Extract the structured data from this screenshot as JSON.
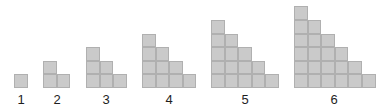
{
  "diagram": {
    "colors": {
      "cell_fill": "#cacaca",
      "cell_border": "#b0b0b0",
      "label": "#1e1e1e",
      "background": "#ffffff"
    },
    "figures": [
      {
        "label": "1",
        "columns": [
          1
        ],
        "left": 14,
        "label_x": 21
      },
      {
        "label": "2",
        "columns": [
          2,
          1
        ],
        "left": 43,
        "label_x": 57
      },
      {
        "label": "3",
        "columns": [
          3,
          2,
          1
        ],
        "left": 86,
        "label_x": 106
      },
      {
        "label": "4",
        "columns": [
          4,
          3,
          2,
          1
        ],
        "left": 142,
        "label_x": 169
      },
      {
        "label": "5",
        "columns": [
          5,
          4,
          3,
          2,
          1
        ],
        "left": 211,
        "label_x": 245
      },
      {
        "label": "6",
        "columns": [
          6,
          5,
          4,
          3,
          2,
          1
        ],
        "left": 294,
        "label_x": 334
      }
    ],
    "baseline_y": 88,
    "label_y": 93,
    "cell_size": 13.6
  }
}
